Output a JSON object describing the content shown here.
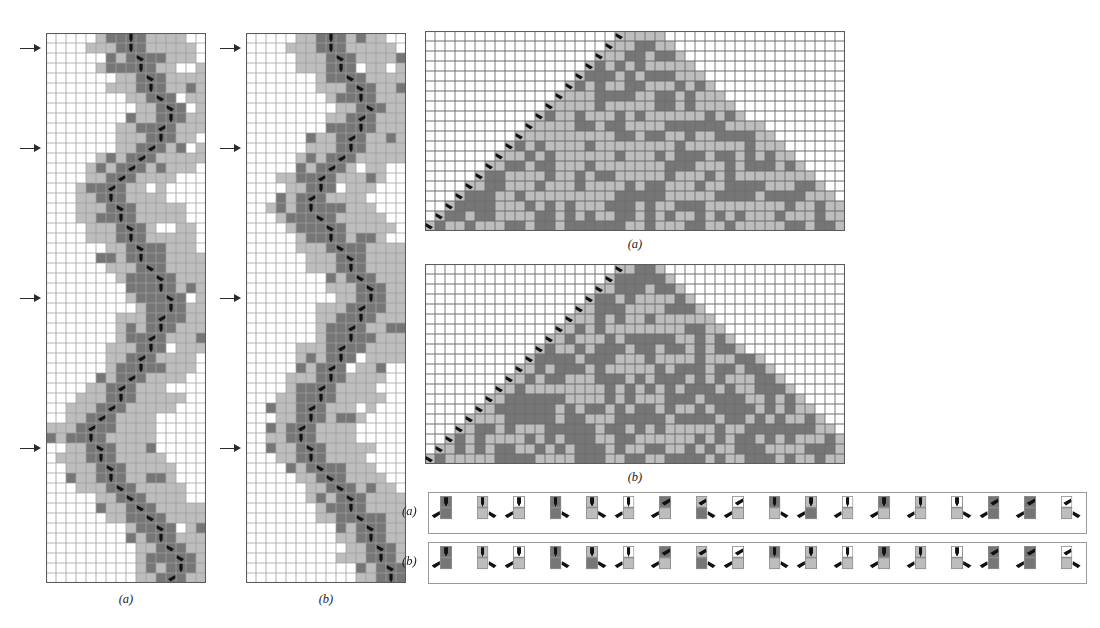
{
  "figure": {
    "kind": "turing-machine-evolution-figure",
    "palette": {
      "white": "#ffffff",
      "light_gray": "#bdbdbd",
      "mid_gray": "#9c9c9c",
      "dark_gray": "#767676",
      "grid_line": "#6e6e6e",
      "grid_line_faint": "#9f9f9f",
      "head_black": "#111111",
      "panel_border": "#5c5c5c",
      "rule_border": "#9a9a9a"
    },
    "captions": {
      "left_a": "(a)",
      "left_b": "(b)",
      "tri_a": "(a)",
      "tri_b": "(b)",
      "rule_a": "(a)",
      "rule_b": "(b)"
    },
    "panels": {
      "left_a": {
        "name": "left-evolution-panel-a",
        "x": 46,
        "y": 33,
        "cols": 16,
        "rows": 55,
        "cell": 10,
        "marker_rows": [
          1,
          11,
          26,
          41
        ],
        "comment": "narrow tall space-time diagram, 3 gray levels plus white"
      },
      "left_b": {
        "name": "left-evolution-panel-b",
        "x": 246,
        "y": 33,
        "cols": 16,
        "rows": 55,
        "cell": 10,
        "marker_rows": [
          1,
          11,
          26,
          41
        ]
      },
      "tri_a": {
        "name": "triangle-panel-a",
        "x": 425,
        "y": 31,
        "cols": 42,
        "rows": 20,
        "cell": 10
      },
      "tri_b": {
        "name": "triangle-panel-b",
        "x": 425,
        "y": 264,
        "cols": 42,
        "rows": 20,
        "cell": 10
      }
    },
    "rules": {
      "cell_count_per_row": 18,
      "row_a_label": "(a)",
      "row_b_label": "(b)",
      "row_a": [
        {
          "in_state": 0,
          "in_color": 2,
          "out_color": 2,
          "out_state": 0,
          "move": "left"
        },
        {
          "in_state": 0,
          "in_color": 1,
          "out_color": 1,
          "out_state": 1,
          "move": "right"
        },
        {
          "in_state": 0,
          "in_color": 0,
          "out_color": 1,
          "out_state": 2,
          "move": "left"
        },
        {
          "in_state": 1,
          "in_color": 2,
          "out_color": 2,
          "out_state": 0,
          "move": "right"
        },
        {
          "in_state": 1,
          "in_color": 1,
          "out_color": 1,
          "out_state": 1,
          "move": "right"
        },
        {
          "in_state": 1,
          "in_color": 0,
          "out_color": 1,
          "out_state": 2,
          "move": "left"
        },
        {
          "in_state": 2,
          "in_color": 2,
          "out_color": 1,
          "out_state": 0,
          "move": "left"
        },
        {
          "in_state": 2,
          "in_color": 1,
          "out_color": 2,
          "out_state": 1,
          "move": "right"
        },
        {
          "in_state": 2,
          "in_color": 0,
          "out_color": 1,
          "out_state": 2,
          "move": "left"
        },
        {
          "in_state": 0,
          "in_color": 2,
          "out_color": 1,
          "out_state": 0,
          "move": "right"
        },
        {
          "in_state": 0,
          "in_color": 1,
          "out_color": 2,
          "out_state": 1,
          "move": "left"
        },
        {
          "in_state": 0,
          "in_color": 0,
          "out_color": 1,
          "out_state": 2,
          "move": "left"
        },
        {
          "in_state": 1,
          "in_color": 2,
          "out_color": 1,
          "out_state": 0,
          "move": "left"
        },
        {
          "in_state": 1,
          "in_color": 1,
          "out_color": 1,
          "out_state": 1,
          "move": "left"
        },
        {
          "in_state": 1,
          "in_color": 0,
          "out_color": 1,
          "out_state": 2,
          "move": "right"
        },
        {
          "in_state": 2,
          "in_color": 2,
          "out_color": 2,
          "out_state": 0,
          "move": "left"
        },
        {
          "in_state": 2,
          "in_color": 2,
          "out_color": 2,
          "out_state": 1,
          "move": "left"
        },
        {
          "in_state": 2,
          "in_color": 0,
          "out_color": 1,
          "out_state": 2,
          "move": "right"
        }
      ],
      "row_b": [
        {
          "in_state": 0,
          "in_color": 2,
          "out_color": 2,
          "out_state": 0,
          "move": "left"
        },
        {
          "in_state": 0,
          "in_color": 1,
          "out_color": 1,
          "out_state": 1,
          "move": "right"
        },
        {
          "in_state": 0,
          "in_color": 0,
          "out_color": 1,
          "out_state": 2,
          "move": "left"
        },
        {
          "in_state": 1,
          "in_color": 2,
          "out_color": 2,
          "out_state": 0,
          "move": "right"
        },
        {
          "in_state": 1,
          "in_color": 1,
          "out_color": 2,
          "out_state": 1,
          "move": "right"
        },
        {
          "in_state": 1,
          "in_color": 0,
          "out_color": 1,
          "out_state": 2,
          "move": "left"
        },
        {
          "in_state": 2,
          "in_color": 2,
          "out_color": 1,
          "out_state": 0,
          "move": "left"
        },
        {
          "in_state": 2,
          "in_color": 1,
          "out_color": 2,
          "out_state": 1,
          "move": "right"
        },
        {
          "in_state": 2,
          "in_color": 0,
          "out_color": 1,
          "out_state": 2,
          "move": "left"
        },
        {
          "in_state": 0,
          "in_color": 2,
          "out_color": 1,
          "out_state": 0,
          "move": "right"
        },
        {
          "in_state": 0,
          "in_color": 1,
          "out_color": 1,
          "out_state": 1,
          "move": "left"
        },
        {
          "in_state": 0,
          "in_color": 0,
          "out_color": 1,
          "out_state": 2,
          "move": "left"
        },
        {
          "in_state": 1,
          "in_color": 2,
          "out_color": 1,
          "out_state": 0,
          "move": "left"
        },
        {
          "in_state": 1,
          "in_color": 1,
          "out_color": 1,
          "out_state": 1,
          "move": "left"
        },
        {
          "in_state": 1,
          "in_color": 0,
          "out_color": 1,
          "out_state": 2,
          "move": "right"
        },
        {
          "in_state": 2,
          "in_color": 2,
          "out_color": 2,
          "out_state": 0,
          "move": "left"
        },
        {
          "in_state": 2,
          "in_color": 2,
          "out_color": 2,
          "out_state": 1,
          "move": "left"
        },
        {
          "in_state": 2,
          "in_color": 0,
          "out_color": 1,
          "out_state": 2,
          "move": "right"
        }
      ]
    }
  },
  "chart_data": {
    "type": "heatmap",
    "title": "",
    "legend": [
      "white = color 0",
      "light gray = color 1",
      "dark gray = color 2"
    ],
    "left_a_grid": {
      "cols": 16,
      "rows": 55,
      "note": "column-band pattern; values are color indices 0..2",
      "head_path": [
        [
          0,
          8
        ],
        [
          1,
          8
        ],
        [
          2,
          9
        ],
        [
          3,
          9
        ],
        [
          4,
          10
        ],
        [
          5,
          10
        ],
        [
          6,
          11
        ],
        [
          7,
          12
        ],
        [
          8,
          12
        ],
        [
          9,
          11
        ],
        [
          10,
          11
        ],
        [
          11,
          10
        ],
        [
          12,
          9
        ],
        [
          13,
          8
        ],
        [
          14,
          7
        ],
        [
          15,
          6
        ],
        [
          16,
          6
        ],
        [
          17,
          7
        ],
        [
          18,
          7
        ],
        [
          19,
          8
        ],
        [
          20,
          8
        ],
        [
          21,
          9
        ],
        [
          22,
          9
        ],
        [
          23,
          10
        ],
        [
          24,
          11
        ],
        [
          25,
          11
        ],
        [
          26,
          12
        ],
        [
          27,
          12
        ],
        [
          28,
          11
        ],
        [
          29,
          11
        ],
        [
          30,
          10
        ],
        [
          31,
          10
        ],
        [
          32,
          9
        ],
        [
          33,
          9
        ],
        [
          34,
          8
        ],
        [
          35,
          7
        ],
        [
          36,
          7
        ],
        [
          37,
          6
        ],
        [
          38,
          5
        ],
        [
          39,
          4
        ],
        [
          40,
          4
        ],
        [
          41,
          5
        ],
        [
          42,
          5
        ],
        [
          43,
          6
        ],
        [
          44,
          6
        ],
        [
          45,
          7
        ],
        [
          46,
          8
        ],
        [
          47,
          9
        ],
        [
          48,
          10
        ],
        [
          49,
          11
        ],
        [
          50,
          11
        ],
        [
          51,
          12
        ],
        [
          52,
          13
        ],
        [
          53,
          13
        ],
        [
          54,
          12
        ]
      ]
    },
    "left_b_grid": {
      "cols": 16,
      "rows": 55,
      "head_path": [
        [
          0,
          8
        ],
        [
          1,
          8
        ],
        [
          2,
          9
        ],
        [
          3,
          9
        ],
        [
          4,
          10
        ],
        [
          5,
          11
        ],
        [
          6,
          11
        ],
        [
          7,
          12
        ],
        [
          8,
          11
        ],
        [
          9,
          11
        ],
        [
          10,
          10
        ],
        [
          11,
          10
        ],
        [
          12,
          9
        ],
        [
          13,
          8
        ],
        [
          14,
          7
        ],
        [
          15,
          7
        ],
        [
          16,
          6
        ],
        [
          17,
          6
        ],
        [
          18,
          7
        ],
        [
          19,
          8
        ],
        [
          20,
          8
        ],
        [
          21,
          9
        ],
        [
          22,
          10
        ],
        [
          23,
          10
        ],
        [
          24,
          11
        ],
        [
          25,
          12
        ],
        [
          26,
          12
        ],
        [
          27,
          11
        ],
        [
          28,
          11
        ],
        [
          29,
          10
        ],
        [
          30,
          10
        ],
        [
          31,
          9
        ],
        [
          32,
          9
        ],
        [
          33,
          8
        ],
        [
          34,
          8
        ],
        [
          35,
          7
        ],
        [
          36,
          7
        ],
        [
          37,
          6
        ],
        [
          38,
          6
        ],
        [
          39,
          5
        ],
        [
          40,
          5
        ],
        [
          41,
          6
        ],
        [
          42,
          6
        ],
        [
          43,
          7
        ],
        [
          44,
          8
        ],
        [
          45,
          9
        ],
        [
          46,
          10
        ],
        [
          47,
          10
        ],
        [
          48,
          11
        ],
        [
          49,
          12
        ],
        [
          50,
          12
        ],
        [
          51,
          13
        ],
        [
          52,
          13
        ],
        [
          53,
          14
        ],
        [
          54,
          14
        ]
      ]
    },
    "tri_a_grid": {
      "cols": 42,
      "rows": 20,
      "note": "triangular growth region; head runs down the left diagonal"
    },
    "tri_b_grid": {
      "cols": 42,
      "rows": 20,
      "note": "denser triangular growth region"
    }
  }
}
